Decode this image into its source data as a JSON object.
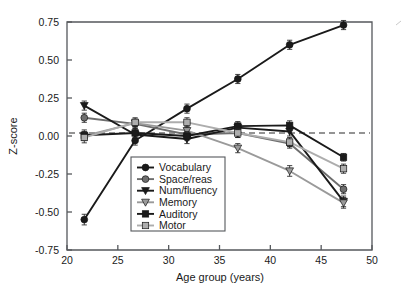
{
  "chart_data": {
    "type": "line",
    "title": "",
    "xlabel": "Age group (years)",
    "ylabel": "Z-score",
    "xlim": [
      20,
      50
    ],
    "ylim": [
      -0.75,
      0.75
    ],
    "xticks": [
      20,
      25,
      30,
      35,
      40,
      45,
      50
    ],
    "xtick_labels": [
      "20",
      "25",
      "30",
      "35",
      "40",
      "45",
      "50"
    ],
    "yticks": [
      -0.75,
      -0.5,
      -0.25,
      0,
      0.25,
      0.5,
      0.75
    ],
    "ytick_labels": [
      "-0.75",
      "-0.50",
      "-0.25",
      "0.00",
      "0.25",
      "0.50",
      "0.75"
    ],
    "grid": false,
    "legend_position": "lower-center-left",
    "reference_line": {
      "type": "horizontal-dashed",
      "y": 0.02
    },
    "x": [
      21.7,
      26.7,
      31.8,
      36.8,
      41.9,
      47.2
    ],
    "series": [
      {
        "name": "Vocabulary",
        "marker": "circle",
        "color": "#1a1a1a",
        "values": [
          -0.55,
          -0.03,
          0.18,
          0.375,
          0.6,
          0.73
        ],
        "errors": [
          0.035,
          0.03,
          0.03,
          0.03,
          0.03,
          0.03
        ]
      },
      {
        "name": "Space/reas",
        "marker": "circle",
        "color": "#6e6e6e",
        "values": [
          0.12,
          0.08,
          0.01,
          0.02,
          -0.05,
          -0.35
        ],
        "errors": [
          0.03,
          0.03,
          0.03,
          0.03,
          0.03,
          0.03
        ]
      },
      {
        "name": "Num/fluency",
        "marker": "triangle-down",
        "color": "#1a1a1a",
        "values": [
          0.2,
          0.01,
          -0.02,
          0.055,
          0.03,
          -0.43
        ],
        "errors": [
          0.03,
          0.03,
          0.03,
          0.03,
          0.03,
          0.035
        ]
      },
      {
        "name": "Memory",
        "marker": "triangle-down",
        "color": "#9a9a9a",
        "values": [
          0.0,
          0.085,
          0.035,
          -0.08,
          -0.23,
          -0.44
        ],
        "errors": [
          0.03,
          0.025,
          0.025,
          0.03,
          0.035,
          0.035
        ]
      },
      {
        "name": "Auditory",
        "marker": "square",
        "color": "#1a1a1a",
        "values": [
          0.005,
          0.02,
          0.0,
          0.065,
          0.07,
          -0.14
        ],
        "errors": [
          0.035,
          0.03,
          0.03,
          0.03,
          0.03,
          0.025
        ]
      },
      {
        "name": "Motor",
        "marker": "square",
        "color": "#adadad",
        "values": [
          -0.01,
          0.09,
          0.09,
          0.02,
          -0.04,
          -0.215
        ],
        "errors": [
          0.035,
          0.03,
          0.03,
          0.03,
          0.03,
          0.03
        ]
      }
    ]
  },
  "legend": {
    "items": [
      {
        "label": "Vocabulary"
      },
      {
        "label": "Space/reas"
      },
      {
        "label": "Num/fluency"
      },
      {
        "label": "Memory"
      },
      {
        "label": "Auditory"
      },
      {
        "label": "Motor"
      }
    ]
  },
  "colors": {
    "axis": "#55585c",
    "text": "#1a1a1a",
    "background": "#ffffff"
  }
}
